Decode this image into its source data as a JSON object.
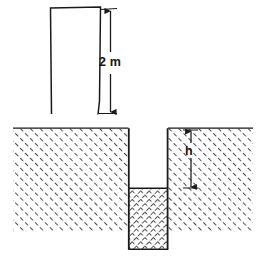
{
  "figure": {
    "background_color": "#ffffff",
    "line_color": "#1a1a1a",
    "hatch_color": "#4a4a4a",
    "labels": {
      "tube_length": "2 m",
      "capillary_rise": "h"
    },
    "tube": {
      "name": "open-ended tube above ground",
      "shape": "inverted-U outline, open at bottom",
      "top_y": 7,
      "bottom_y": 114,
      "left_x": 50,
      "right_x": 100,
      "fill": "none"
    },
    "ground": {
      "name": "soil mass",
      "surface_y": 128,
      "bottom_y": 232,
      "left_x": 13,
      "right_x": 253,
      "hatch_pattern": "diagonal-45-up-right"
    },
    "void_column": {
      "name": "empty tube section below ground surface",
      "left_x": 128,
      "right_x": 168,
      "top_y": 128,
      "bottom_y": 188,
      "fill": "white"
    },
    "saturated_column": {
      "name": "saturated soil column below tube",
      "left_x": 128,
      "right_x": 168,
      "top_y": 188,
      "bottom_y": 249,
      "hatch_pattern": "cross-hatch-dense"
    },
    "dimension_lines": [
      {
        "name": "tube-length-dimension",
        "label": "2 m",
        "orientation": "vertical",
        "x": 110,
        "from_y": 10,
        "to_y": 113,
        "arrowheads": "both"
      },
      {
        "name": "capillary-rise-dimension",
        "label": "h",
        "orientation": "vertical",
        "x": 191,
        "from_y": 130,
        "to_y": 188,
        "arrowheads": "both"
      }
    ]
  }
}
